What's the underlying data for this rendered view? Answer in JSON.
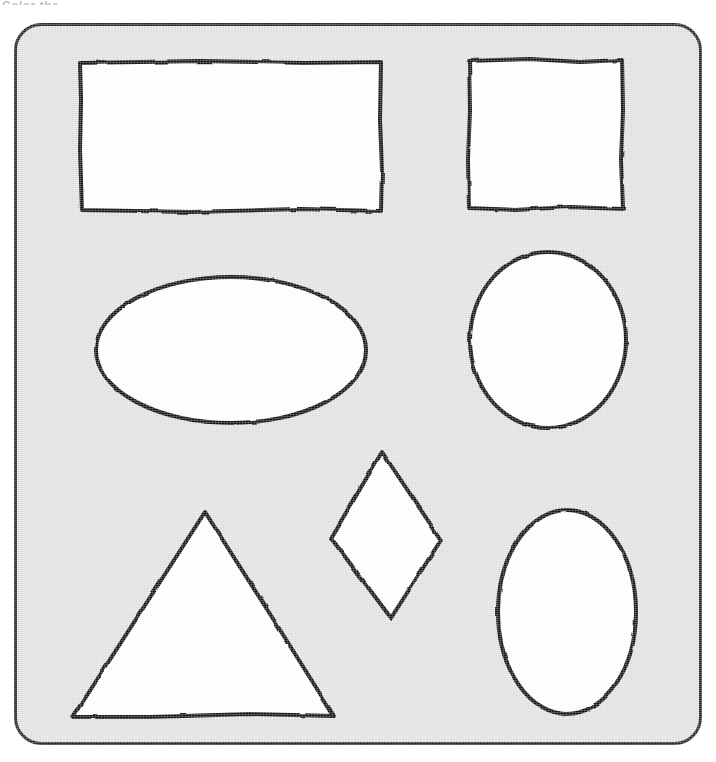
{
  "page": {
    "width": 716,
    "height": 762,
    "background_color": "#ffffff",
    "top_caption_partial": "Color the"
  },
  "card": {
    "label": "shapes-card",
    "fill_color": "#e3e3e3",
    "border_color": "#2b2b2b",
    "x": 14,
    "y": 23,
    "width": 688,
    "height": 722,
    "corner_radius": 26,
    "border_width": 3
  },
  "style": {
    "stroke_color": "#151515",
    "shape_fill": "#ffffff",
    "stroke_width": 4,
    "hand_drawn": true
  },
  "shapes": [
    {
      "id": "rectangle",
      "name": "rectangle",
      "label": "Rectangle",
      "row": 1,
      "column": 1,
      "sides": 4,
      "bounds": {
        "x": 80,
        "y": 62,
        "width": 301,
        "height": 149
      }
    },
    {
      "id": "square",
      "name": "square",
      "label": "Square",
      "row": 1,
      "column": 2,
      "sides": 4,
      "bounds": {
        "x": 468,
        "y": 60,
        "width": 155,
        "height": 150
      }
    },
    {
      "id": "oval",
      "name": "oval",
      "label": "Oval",
      "row": 2,
      "column": 1,
      "sides": 0,
      "bounds": {
        "x": 96,
        "y": 277,
        "width": 270,
        "height": 147
      }
    },
    {
      "id": "circle",
      "name": "circle",
      "label": "Circle",
      "row": 2,
      "column": 2,
      "sides": 0,
      "bounds": {
        "x": 470,
        "y": 252,
        "width": 157,
        "height": 176
      }
    },
    {
      "id": "triangle",
      "name": "triangle",
      "label": "Triangle",
      "row": 3,
      "column": 1,
      "sides": 3,
      "bounds": {
        "x": 73,
        "y": 512,
        "width": 261,
        "height": 205
      }
    },
    {
      "id": "diamond",
      "name": "diamond",
      "label": "Diamond",
      "row": 3,
      "column": 2,
      "sides": 4,
      "bounds": {
        "x": 331,
        "y": 452,
        "width": 110,
        "height": 166
      }
    },
    {
      "id": "vertical-oval",
      "name": "vertical-oval",
      "label": "Oval",
      "row": 3,
      "column": 3,
      "sides": 0,
      "bounds": {
        "x": 498,
        "y": 510,
        "width": 138,
        "height": 204
      }
    }
  ]
}
